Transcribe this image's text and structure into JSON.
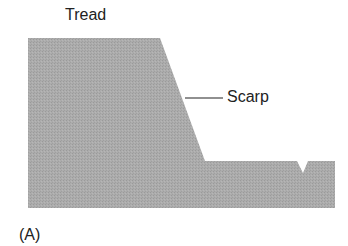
{
  "diagram": {
    "labels": {
      "tread": "Tread",
      "scarp": "Scarp",
      "panel": "(A)"
    },
    "colors": {
      "terrain_fill": "#a8a8a8",
      "text": "#222222",
      "leader_line": "#222222",
      "background": "#ffffff"
    },
    "shape": {
      "description": "Cross-section profile of terrace: high flat tread, sloping scarp, lower surface with small notch",
      "points": [
        [
          28,
          38
        ],
        [
          160,
          38
        ],
        [
          205,
          161
        ],
        [
          297,
          161
        ],
        [
          303,
          173
        ],
        [
          308,
          161
        ],
        [
          335,
          161
        ],
        [
          335,
          208
        ],
        [
          28,
          208
        ]
      ]
    }
  }
}
